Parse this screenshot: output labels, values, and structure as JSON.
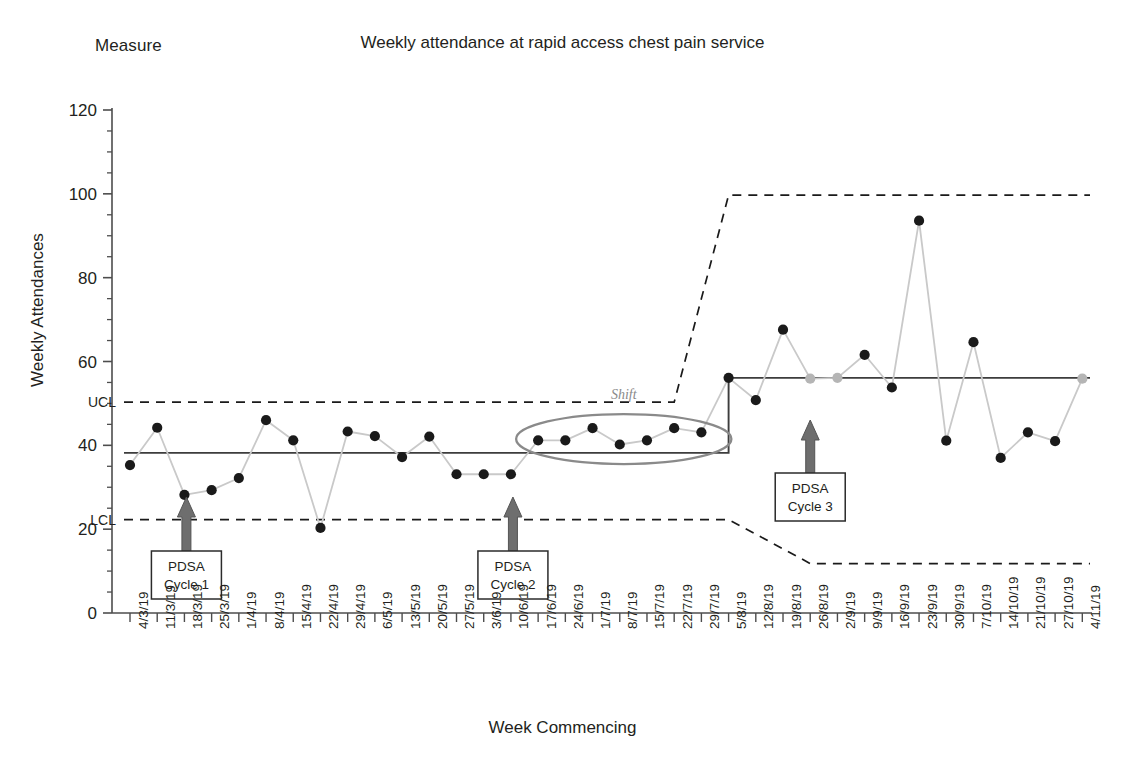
{
  "header": {
    "measure_label": "Measure",
    "title": "Weekly attendance at rapid access chest pain service"
  },
  "axes": {
    "y_title": "Weekly Attendances",
    "x_title": "Week Commencing",
    "y_ticks": [
      "0",
      "20",
      "40",
      "60",
      "80",
      "100",
      "120"
    ],
    "y_min": 0,
    "y_max": 120,
    "y_minor_step": 5
  },
  "annotations": {
    "ucl_label": "UCL",
    "lcl_label": "LCL",
    "shift_label": "Shift",
    "pdsa": [
      {
        "line1": "PDSA",
        "line2": "Cycle 1",
        "x_index": 2
      },
      {
        "line1": "PDSA",
        "line2": "Cycle 2",
        "x_index": 14
      },
      {
        "line1": "PDSA",
        "line2": "Cycle 3",
        "x_index": 25
      }
    ]
  },
  "colors": {
    "series_line": "#c9c9c9",
    "marker": "#1a1a1a",
    "marker_muted": "#b5b5b5",
    "mean_line": "#3d3d3d",
    "limit_line": "#1a1a1a",
    "arrow": "#6e6e6e",
    "ellipse": "#8a8a8a",
    "axis": "#4d4d4d",
    "text": "#231f20"
  },
  "chart_data": {
    "type": "line",
    "title": "Weekly attendance at rapid access chest pain service",
    "xlabel": "Week Commencing",
    "ylabel": "Weekly Attendances",
    "ylim": [
      0,
      120
    ],
    "grid": false,
    "legend": "none",
    "categories": [
      "4/3/19",
      "11/3/19",
      "18/3/19",
      "25/3/19",
      "1/4/19",
      "8/4/19",
      "15/4/19",
      "22/4/19",
      "29/4/19",
      "6/5/19",
      "13/5/19",
      "20/5/19",
      "27/5/19",
      "3/6/19",
      "10/6/19",
      "17/6/19",
      "24/6/19",
      "1/7/19",
      "8/7/19",
      "15/7/19",
      "22/7/19",
      "29/7/19",
      "5/8/19",
      "12/8/19",
      "19/8/19",
      "26/8/19",
      "2/9/19",
      "9/9/19",
      "16/9/19",
      "23/9/19",
      "30/9/19",
      "7/10/19",
      "14/10/19",
      "21/10/19",
      "27/10/19",
      "4/11/19"
    ],
    "series": [
      {
        "name": "Weekly Attendances",
        "values": [
          35.3,
          44.2,
          28.2,
          29.3,
          32.2,
          46.0,
          41.2,
          20.3,
          43.3,
          42.2,
          37.2,
          42.1,
          33.1,
          33.1,
          33.1,
          41.2,
          41.2,
          44.1,
          40.2,
          41.2,
          44.1,
          43.1,
          56.1,
          50.8,
          67.6,
          55.9,
          56.1,
          61.6,
          53.8,
          93.6,
          41.1,
          64.6,
          37.0,
          43.1,
          41.0,
          55.9
        ],
        "muted_point_indices": [
          25,
          26,
          35
        ]
      }
    ],
    "control_limits": {
      "mean_phase1": 38.2,
      "mean_phase2": 56.1,
      "mean_shift_index": 22,
      "ucl_phase1": 50.3,
      "ucl_phase2": 99.7,
      "lcl_phase1": 22.3,
      "lcl_phase2": 11.8,
      "ucl_transition_start_index": 20,
      "ucl_transition_end_index": 22,
      "lcl_transition_start_index": 22,
      "lcl_transition_end_index": 25
    },
    "shift_highlight": {
      "from_index": 15,
      "to_index": 21,
      "label": "Shift"
    }
  }
}
